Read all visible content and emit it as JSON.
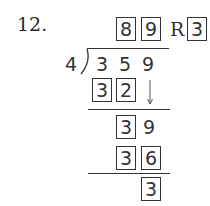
{
  "problem": {
    "number": "12.",
    "divisor": "4",
    "dividend": [
      "3",
      "5",
      "9"
    ],
    "quotient": [
      "8",
      "9"
    ],
    "remainder_label": "R",
    "remainder": "3",
    "steps": [
      {
        "product": [
          "3",
          "2"
        ],
        "bring_down": "arrow-down"
      },
      {
        "difference": [
          "3"
        ],
        "brought_down": "9"
      },
      {
        "product": [
          "3",
          "6"
        ]
      },
      {
        "final_remainder": "3"
      }
    ]
  }
}
